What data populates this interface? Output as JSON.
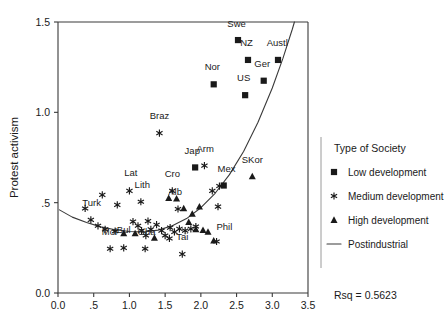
{
  "chart_data": {
    "type": "scatter",
    "title": "",
    "xlabel": "",
    "ylabel": "Protest activism",
    "xlim": [
      0.0,
      3.5
    ],
    "ylim": [
      0.0,
      1.5
    ],
    "grid": false,
    "xticks": [
      "0.0",
      ".5",
      "1.0",
      "1.5",
      "2.0",
      "2.5",
      "3.0",
      "3.5"
    ],
    "xtick_values": [
      0.0,
      0.5,
      1.0,
      1.5,
      2.0,
      2.5,
      3.0,
      3.5
    ],
    "yticks": [
      "0.0",
      ".5",
      "1.0",
      "1.5"
    ],
    "ytick_values": [
      0.0,
      0.5,
      1.0,
      1.5
    ],
    "annotation": "Rsq = 0.5623",
    "legend_position": "right",
    "legend_title": "Type of Society",
    "series": [
      {
        "name": "Low development",
        "marker": "square",
        "points": [
          {
            "label": "Swe",
            "x": 2.52,
            "y": 1.4,
            "lx": 2.5,
            "ly": 1.475,
            "lanchor": "middle"
          },
          {
            "label": "NZ",
            "x": 2.66,
            "y": 1.29,
            "lx": 2.64,
            "ly": 1.365,
            "lanchor": "middle"
          },
          {
            "label": "Austl",
            "x": 3.08,
            "y": 1.29,
            "lx": 3.07,
            "ly": 1.365,
            "lanchor": "middle"
          },
          {
            "label": "Nor",
            "x": 2.18,
            "y": 1.155,
            "lx": 2.16,
            "ly": 1.235,
            "lanchor": "middle"
          },
          {
            "label": "Ger",
            "x": 2.88,
            "y": 1.175,
            "lx": 2.86,
            "ly": 1.253,
            "lanchor": "middle"
          },
          {
            "label": "US",
            "x": 2.62,
            "y": 1.095,
            "lx": 2.6,
            "ly": 1.175,
            "lanchor": "middle"
          },
          {
            "label": "Jap",
            "x": 1.92,
            "y": 0.695,
            "lx": 1.88,
            "ly": 0.768,
            "lanchor": "middle"
          },
          {
            "label": "Mex",
            "x": 2.32,
            "y": 0.595,
            "lx": 2.36,
            "ly": 0.672,
            "lanchor": "middle"
          }
        ]
      },
      {
        "name": "Medium development",
        "marker": "asterisk",
        "points": [
          {
            "label": "Braz",
            "x": 1.42,
            "y": 0.885,
            "lx": 1.42,
            "ly": 0.963,
            "lanchor": "middle"
          },
          {
            "label": "Arm",
            "x": 2.05,
            "y": 0.705,
            "lx": 2.06,
            "ly": 0.783,
            "lanchor": "middle"
          },
          {
            "label": "Lat",
            "x": 1.0,
            "y": 0.565,
            "lx": 1.02,
            "ly": 0.645,
            "lanchor": "middle"
          },
          {
            "label": "Lith",
            "x": 1.16,
            "y": 0.505,
            "lx": 1.18,
            "ly": 0.583,
            "lanchor": "middle"
          },
          {
            "label": "Cro",
            "x": 1.6,
            "y": 0.565,
            "lx": 1.6,
            "ly": 0.643,
            "lanchor": "middle"
          },
          {
            "label": "Alb",
            "x": 1.68,
            "y": 0.465,
            "lx": 1.64,
            "ly": 0.543,
            "lanchor": "middle"
          },
          {
            "label": "Turk",
            "x": 0.46,
            "y": 0.405,
            "lx": 0.47,
            "ly": 0.482,
            "lanchor": "middle"
          },
          {
            "label": "Mol",
            "x": 0.73,
            "y": 0.245,
            "lx": 0.72,
            "ly": 0.322,
            "lanchor": "middle"
          },
          {
            "label": "Bul",
            "x": 0.92,
            "y": 0.25,
            "lx": 0.92,
            "ly": 0.33,
            "lanchor": "middle"
          },
          {
            "label": "Gha",
            "x": 1.22,
            "y": 0.245,
            "lx": 1.24,
            "ly": 0.322,
            "lanchor": "middle"
          },
          {
            "label": "Tai",
            "x": 1.74,
            "y": 0.215,
            "lx": 1.74,
            "ly": 0.292,
            "lanchor": "middle"
          },
          {
            "label": "Phil",
            "x": 2.22,
            "y": 0.285,
            "lx": 2.33,
            "ly": 0.348,
            "lanchor": "middle"
          },
          {
            "label": "",
            "x": 0.38,
            "y": 0.468
          },
          {
            "label": "",
            "x": 0.56,
            "y": 0.372
          },
          {
            "label": "",
            "x": 0.66,
            "y": 0.352
          },
          {
            "label": "",
            "x": 0.8,
            "y": 0.342
          },
          {
            "label": "",
            "x": 0.62,
            "y": 0.543
          },
          {
            "label": "",
            "x": 0.83,
            "y": 0.488
          },
          {
            "label": "",
            "x": 1.05,
            "y": 0.395
          },
          {
            "label": "",
            "x": 1.12,
            "y": 0.372
          },
          {
            "label": "",
            "x": 1.17,
            "y": 0.345
          },
          {
            "label": "",
            "x": 1.26,
            "y": 0.398
          },
          {
            "label": "",
            "x": 1.3,
            "y": 0.352
          },
          {
            "label": "",
            "x": 1.23,
            "y": 0.318
          },
          {
            "label": "",
            "x": 1.38,
            "y": 0.378
          },
          {
            "label": "",
            "x": 1.45,
            "y": 0.345
          },
          {
            "label": "",
            "x": 1.5,
            "y": 0.318
          },
          {
            "label": "",
            "x": 1.57,
            "y": 0.362
          },
          {
            "label": "",
            "x": 1.63,
            "y": 0.338
          },
          {
            "label": "",
            "x": 1.7,
            "y": 0.355
          },
          {
            "label": "",
            "x": 1.56,
            "y": 0.302
          },
          {
            "label": "",
            "x": 1.78,
            "y": 0.345
          },
          {
            "label": "",
            "x": 1.86,
            "y": 0.355
          },
          {
            "label": "",
            "x": 1.93,
            "y": 0.368
          },
          {
            "label": "",
            "x": 2.24,
            "y": 0.478
          },
          {
            "label": "",
            "x": 2.26,
            "y": 0.592
          },
          {
            "label": "",
            "x": 2.16,
            "y": 0.565
          }
        ]
      },
      {
        "name": "High development",
        "marker": "triangle",
        "points": [
          {
            "label": "SKor",
            "x": 2.72,
            "y": 0.645,
            "lx": 2.72,
            "ly": 0.722,
            "lanchor": "middle"
          },
          {
            "label": "",
            "x": 1.55,
            "y": 0.525
          },
          {
            "label": "",
            "x": 1.66,
            "y": 0.522
          },
          {
            "label": "",
            "x": 1.76,
            "y": 0.468
          },
          {
            "label": "",
            "x": 1.88,
            "y": 0.438
          },
          {
            "label": "",
            "x": 1.98,
            "y": 0.478
          },
          {
            "label": "",
            "x": 1.83,
            "y": 0.392
          },
          {
            "label": "",
            "x": 1.93,
            "y": 0.352
          },
          {
            "label": "",
            "x": 2.03,
            "y": 0.348
          },
          {
            "label": "",
            "x": 2.1,
            "y": 0.338
          },
          {
            "label": "",
            "x": 0.92,
            "y": 0.33
          },
          {
            "label": "",
            "x": 1.08,
            "y": 0.33
          },
          {
            "label": "",
            "x": 2.18,
            "y": 0.29
          },
          {
            "label": "",
            "x": 1.35,
            "y": 0.305
          }
        ]
      },
      {
        "name": "Postindustrial",
        "marker": "line",
        "points": []
      }
    ],
    "fit_curve": [
      {
        "x": 0.02,
        "y": 0.46
      },
      {
        "x": 0.2,
        "y": 0.42
      },
      {
        "x": 0.4,
        "y": 0.39
      },
      {
        "x": 0.6,
        "y": 0.366
      },
      {
        "x": 0.8,
        "y": 0.35
      },
      {
        "x": 1.0,
        "y": 0.34
      },
      {
        "x": 1.2,
        "y": 0.338
      },
      {
        "x": 1.4,
        "y": 0.348
      },
      {
        "x": 1.6,
        "y": 0.372
      },
      {
        "x": 1.8,
        "y": 0.412
      },
      {
        "x": 2.0,
        "y": 0.472
      },
      {
        "x": 2.2,
        "y": 0.552
      },
      {
        "x": 2.4,
        "y": 0.655
      },
      {
        "x": 2.6,
        "y": 0.785
      },
      {
        "x": 2.8,
        "y": 0.945
      },
      {
        "x": 3.0,
        "y": 1.135
      },
      {
        "x": 3.15,
        "y": 1.3
      },
      {
        "x": 3.28,
        "y": 1.46
      },
      {
        "x": 3.31,
        "y": 1.5
      }
    ]
  },
  "legend": {
    "title": "Type of Society",
    "items": [
      {
        "label": "Low development",
        "marker": "square"
      },
      {
        "label": "Medium development",
        "marker": "asterisk"
      },
      {
        "label": "High development",
        "marker": "triangle"
      },
      {
        "label": "Postindustrial",
        "marker": "line"
      }
    ]
  }
}
